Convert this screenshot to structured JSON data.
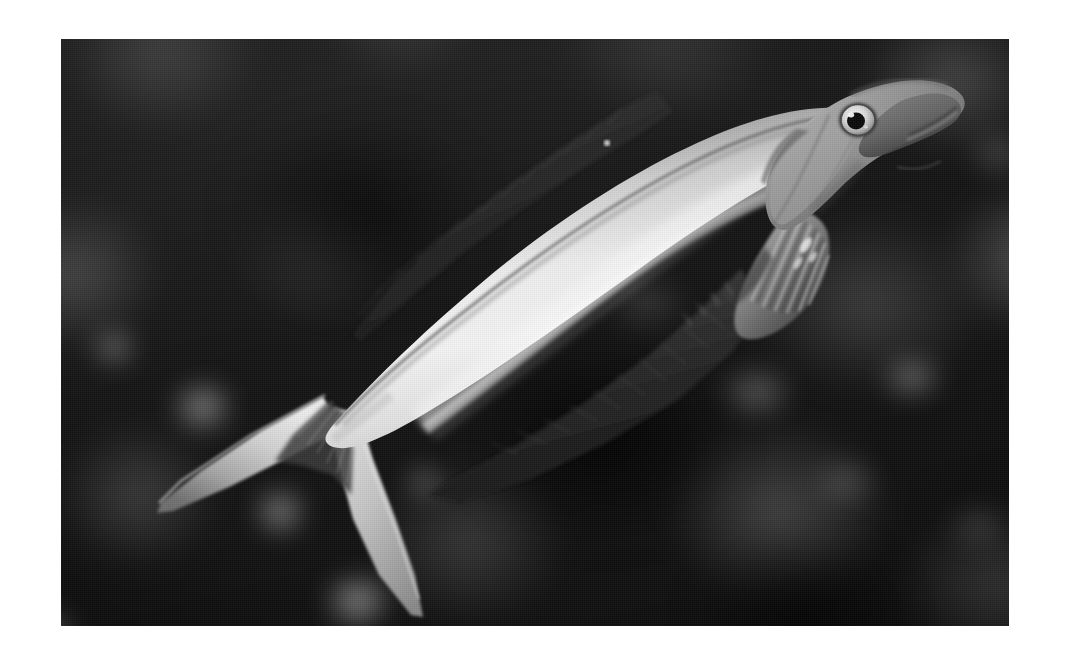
{
  "page": {
    "background_color": "#ffffff",
    "width": 1070,
    "height": 664
  },
  "photo": {
    "alt_text": "Black and white underwater photograph of a slender fish swimming above a blurred coral reef",
    "frame": {
      "left": 61,
      "top": 39,
      "width": 948,
      "height": 587
    },
    "color_mode": "grayscale",
    "background_description": "Out-of-focus dark reef rubble with scattered pale blotches",
    "background_colors": {
      "darkest": "#080808",
      "dark": "#1a1a1a",
      "mid": "#4a4a4a",
      "light_blotch": "#c8c8c8"
    },
    "subject": {
      "name": "fish",
      "common_description": "Slender-bodied reef fish with deeply forked tail",
      "orientation": "head upper-right, tail lower-left",
      "body_colors": {
        "belly_highlight": "#f2f2f2",
        "flank": "#d8d8d8",
        "dorsal_shade": "#8a8a8a",
        "head": "#9a9a9a",
        "fin_dark": "#1e1e1e",
        "eye_iris": "#e8e8e8",
        "eye_pupil": "#0a0a0a"
      },
      "parts": [
        {
          "label": "head",
          "position": "upper-right"
        },
        {
          "label": "eye",
          "position": "x 858, y 120"
        },
        {
          "label": "mouth",
          "position": "right of eye"
        },
        {
          "label": "operculum",
          "position": "behind head"
        },
        {
          "label": "pectoral-fin",
          "position": "x 720-800, y 215-305"
        },
        {
          "label": "dorsal-fin",
          "position": "long, along upper back"
        },
        {
          "label": "anal-fin",
          "position": "long, along lower body"
        },
        {
          "label": "caudal-fin",
          "position": "deeply forked, lower-left"
        }
      ]
    }
  }
}
